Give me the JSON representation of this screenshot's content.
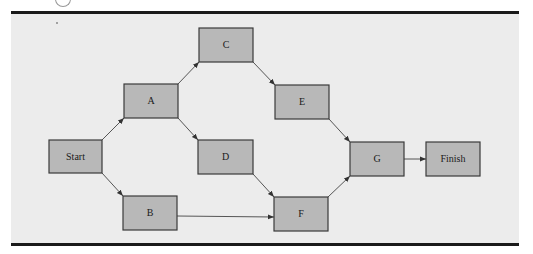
{
  "diagram": {
    "type": "network-activity-diagram",
    "nodes": [
      {
        "id": "start",
        "label": "Start"
      },
      {
        "id": "A",
        "label": "A"
      },
      {
        "id": "B",
        "label": "B"
      },
      {
        "id": "C",
        "label": "C"
      },
      {
        "id": "D",
        "label": "D"
      },
      {
        "id": "E",
        "label": "E"
      },
      {
        "id": "F",
        "label": "F"
      },
      {
        "id": "G",
        "label": "G"
      },
      {
        "id": "finish",
        "label": "Finish"
      }
    ],
    "edges": [
      {
        "from": "start",
        "to": "A"
      },
      {
        "from": "start",
        "to": "B"
      },
      {
        "from": "A",
        "to": "C"
      },
      {
        "from": "A",
        "to": "D"
      },
      {
        "from": "C",
        "to": "E"
      },
      {
        "from": "D",
        "to": "F"
      },
      {
        "from": "B",
        "to": "F"
      },
      {
        "from": "E",
        "to": "G"
      },
      {
        "from": "F",
        "to": "G"
      },
      {
        "from": "G",
        "to": "finish"
      }
    ]
  }
}
